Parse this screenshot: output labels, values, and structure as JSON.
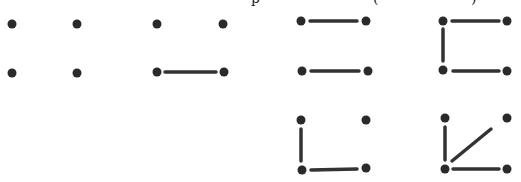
{
  "header": {
    "note": "Top caption line cropped; only descender fragments visible",
    "fragments": [
      {
        "text": "p",
        "x": 251
      },
      {
        "text": "(",
        "x": 373
      },
      {
        "text": ")",
        "x": 471
      }
    ]
  },
  "style": {
    "dot_color": "#2a2a2a",
    "line_color": "#333333",
    "dot_radius": 4.5,
    "line_width": 3.5
  },
  "figures": [
    {
      "id": "fig-1",
      "dots": [
        [
          12,
          24
        ],
        [
          77,
          24
        ],
        [
          12,
          73
        ],
        [
          77,
          73
        ]
      ],
      "edges": []
    },
    {
      "id": "fig-2",
      "dots": [
        [
          157,
          24
        ],
        [
          223,
          24
        ],
        [
          157,
          72
        ],
        [
          224,
          72
        ]
      ],
      "edges": [
        [
          [
            165,
            72
          ],
          [
            216,
            72
          ]
        ]
      ]
    },
    {
      "id": "fig-3",
      "dots": [
        [
          301,
          21
        ],
        [
          366,
          21
        ],
        [
          302,
          71
        ],
        [
          368,
          71
        ]
      ],
      "edges": [
        [
          [
            310,
            21
          ],
          [
            357,
            21
          ]
        ],
        [
          [
            311,
            71
          ],
          [
            359,
            71
          ]
        ]
      ]
    },
    {
      "id": "fig-4",
      "dots": [
        [
          443,
          21
        ],
        [
          507,
          21
        ],
        [
          443,
          70
        ],
        [
          507,
          71
        ]
      ],
      "edges": [
        [
          [
            452,
            21
          ],
          [
            499,
            21
          ]
        ],
        [
          [
            443,
            29
          ],
          [
            443,
            61
          ]
        ],
        [
          [
            453,
            71
          ],
          [
            499,
            71
          ]
        ]
      ]
    },
    {
      "id": "fig-5",
      "dots": [
        [
          301,
          120
        ],
        [
          366,
          120
        ],
        [
          302,
          170
        ],
        [
          366,
          168
        ]
      ],
      "edges": [
        [
          [
            301,
            129
          ],
          [
            301,
            161
          ]
        ],
        [
          [
            311,
            170
          ],
          [
            357,
            169
          ]
        ]
      ]
    },
    {
      "id": "fig-6",
      "dots": [
        [
          445,
          118
        ],
        [
          507,
          118
        ],
        [
          445,
          169
        ],
        [
          507,
          169
        ]
      ],
      "edges": [
        [
          [
            445,
            127
          ],
          [
            445,
            160
          ]
        ],
        [
          [
            453,
            169
          ],
          [
            499,
            169
          ]
        ],
        [
          [
            452,
            161
          ],
          [
            491,
            129
          ]
        ]
      ]
    }
  ]
}
